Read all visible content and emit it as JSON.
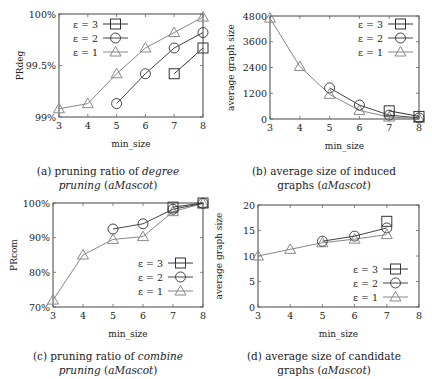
{
  "chart_data": [
    {
      "id": "a",
      "type": "line",
      "caption_prefix": "(a) pruning ratio of ",
      "caption_italic": "degree",
      "caption_line2_italic": "pruning",
      "caption_suffix": " (aMascot)",
      "caption_suffix_plain": " (",
      "caption_suffix_italic": "aMascot",
      "caption_suffix_end": ")",
      "xlabel": "min_size",
      "ylabel": "PRdeg",
      "xlim": [
        3,
        8
      ],
      "ylim": [
        99,
        100
      ],
      "xticks": [
        3,
        4,
        5,
        6,
        7,
        8
      ],
      "yticks": [
        99,
        99.5,
        100
      ],
      "ytick_labels": [
        "99%",
        "99.5%",
        "100%"
      ],
      "legend_position": "upper-left",
      "plot_box": {
        "x0": 59,
        "y0": 14,
        "x1": 203,
        "y1": 117
      },
      "legend_box": {
        "x": 70,
        "y": 24
      },
      "series": [
        {
          "name": "ε = 3",
          "marker": "square",
          "color": "#333333",
          "x": [
            7,
            8
          ],
          "values": [
            99.42,
            99.67
          ]
        },
        {
          "name": "ε = 2",
          "marker": "circle",
          "color": "#444444",
          "x": [
            5,
            6,
            7,
            8
          ],
          "values": [
            99.13,
            99.42,
            99.67,
            99.82
          ]
        },
        {
          "name": "ε = 1",
          "marker": "triangle",
          "color": "#888888",
          "x": [
            3,
            4,
            5,
            6,
            7,
            8
          ],
          "values": [
            99.08,
            99.13,
            99.42,
            99.67,
            99.82,
            99.97
          ]
        }
      ]
    },
    {
      "id": "b",
      "type": "line",
      "caption_line1": "(b) average size of induced",
      "caption_line2_plain": "graphs (",
      "caption_line2_italic": "aMascot",
      "caption_line2_end": ")",
      "xlabel": "min_size",
      "ylabel": "average graph size",
      "xlim": [
        3,
        8
      ],
      "ylim": [
        0,
        4800
      ],
      "xticks": [
        3,
        4,
        5,
        6,
        7,
        8
      ],
      "yticks": [
        0,
        1200,
        2400,
        3600,
        4800
      ],
      "ytick_labels": [
        "0",
        "1200",
        "2400",
        "3600",
        "4800"
      ],
      "legend_position": "upper-right",
      "plot_box": {
        "x0": 270,
        "y0": 16,
        "x1": 419,
        "y1": 119
      },
      "legend_box": {
        "x": 355,
        "y": 24
      },
      "series": [
        {
          "name": "ε = 3",
          "marker": "square",
          "color": "#333333",
          "x": [
            7,
            8
          ],
          "values": [
            380,
            120
          ]
        },
        {
          "name": "ε = 2",
          "marker": "circle",
          "color": "#444444",
          "x": [
            5,
            6,
            7,
            8
          ],
          "values": [
            1450,
            650,
            180,
            50
          ]
        },
        {
          "name": "ε = 1",
          "marker": "triangle",
          "color": "#888888",
          "x": [
            3,
            4,
            5,
            6,
            7,
            8
          ],
          "values": [
            4700,
            2450,
            1150,
            400,
            90,
            20
          ]
        }
      ]
    },
    {
      "id": "c",
      "type": "line",
      "caption_prefix": "(c) pruning ratio of ",
      "caption_italic": "combine",
      "caption_line2_italic": "pruning",
      "caption_suffix_plain": " (",
      "caption_suffix_italic": "aMascot",
      "caption_suffix_end": ")",
      "xlabel": "min_size",
      "ylabel": "PRcom",
      "xlim": [
        3,
        8
      ],
      "ylim": [
        70,
        100
      ],
      "xticks": [
        3,
        4,
        5,
        6,
        7,
        8
      ],
      "yticks": [
        70,
        80,
        90,
        100
      ],
      "ytick_labels": [
        "70%",
        "80%",
        "90%",
        "100%"
      ],
      "legend_position": "lower-right",
      "plot_box": {
        "x0": 53,
        "y0": 203,
        "x1": 203,
        "y1": 307
      },
      "legend_box": {
        "x": 135,
        "y": 263
      },
      "series": [
        {
          "name": "ε = 3",
          "marker": "square",
          "color": "#333333",
          "x": [
            7,
            8
          ],
          "values": [
            98.8,
            100
          ]
        },
        {
          "name": "ε = 2",
          "marker": "circle",
          "color": "#444444",
          "x": [
            5,
            6,
            7,
            8
          ],
          "values": [
            92.5,
            94,
            98.2,
            99.9
          ]
        },
        {
          "name": "ε = 1",
          "marker": "triangle",
          "color": "#888888",
          "x": [
            3,
            4,
            5,
            6,
            7,
            8
          ],
          "values": [
            72,
            85,
            89.5,
            90.3,
            97.5,
            99.9
          ]
        }
      ]
    },
    {
      "id": "d",
      "type": "line",
      "caption_line1": "(d) average size of candidate",
      "caption_line2_plain": "graphs (",
      "caption_line2_italic": "aMascot",
      "caption_line2_end": ")",
      "xlabel": "min_size",
      "ylabel": "average graph size",
      "xlim": [
        3,
        8
      ],
      "ylim": [
        0,
        20
      ],
      "xticks": [
        3,
        4,
        5,
        6,
        7,
        8
      ],
      "yticks": [
        0,
        5,
        10,
        15,
        20
      ],
      "ytick_labels": [
        "0",
        "5",
        "10",
        "15",
        "20"
      ],
      "legend_position": "lower-right",
      "plot_box": {
        "x0": 258,
        "y0": 205,
        "x1": 419,
        "y1": 307
      },
      "legend_box": {
        "x": 350,
        "y": 269
      },
      "series": [
        {
          "name": "ε = 3",
          "marker": "square",
          "color": "#333333",
          "x": [
            7
          ],
          "values": [
            16.8
          ]
        },
        {
          "name": "ε = 2",
          "marker": "circle",
          "color": "#444444",
          "x": [
            5,
            6,
            7
          ],
          "values": [
            12.9,
            13.9,
            15.5
          ]
        },
        {
          "name": "ε = 1",
          "marker": "triangle",
          "color": "#888888",
          "x": [
            3,
            4,
            5,
            6,
            7
          ],
          "values": [
            10,
            11.3,
            12.6,
            13.3,
            14.2
          ]
        }
      ]
    }
  ],
  "captions": {
    "a": {
      "prefix": "(a) pruning ratio of ",
      "italic1": "degree",
      "line2_italic": "pruning",
      "line2_plain": " (",
      "line2_italic2": "aMascot",
      "line2_end": ")"
    },
    "b": {
      "line1": "(b) average size of induced",
      "line2_plain": "graphs (",
      "line2_italic": "aMascot",
      "line2_end": ")"
    },
    "c": {
      "prefix": "(c) pruning ratio of ",
      "italic1": "combine",
      "line2_italic": "pruning",
      "line2_plain": " (",
      "line2_italic2": "aMascot",
      "line2_end": ")"
    },
    "d": {
      "line1": "(d) average size of candidate",
      "line2_plain": "graphs (",
      "line2_italic": "aMascot",
      "line2_end": ")"
    }
  }
}
